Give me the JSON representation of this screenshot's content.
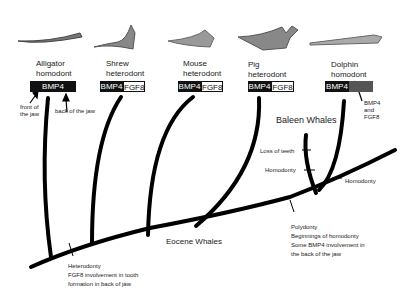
{
  "taxa": [
    {
      "name": "Alligator",
      "dentition": "homodont",
      "genes": [
        "BMP4"
      ]
    },
    {
      "name": "Shrew",
      "dentition": "heterodont",
      "genes": [
        "BMP4",
        "FGF8"
      ]
    },
    {
      "name": "Mouse",
      "dentition": "heterodont",
      "genes": [
        "BMP4",
        "FGF8"
      ]
    },
    {
      "name": "Pig",
      "dentition": "heterodont",
      "genes": [
        "BMP4",
        "FGF8"
      ]
    },
    {
      "name": "Dolphin",
      "dentition": "homodont",
      "genes": [
        "BMP4",
        ""
      ]
    }
  ],
  "annotations": {
    "front_of_jaw": "front of the jaw",
    "back_of_jaw": "back of the jaw",
    "dolphin_gray": "BMP4 and FGF8",
    "baleen": "Baleen Whales",
    "loss_of_teeth": "Loss of teeth",
    "homodonty_baleen": "Homodonty",
    "homodonty_dolphin": "Homodonty",
    "eocene": "Eocene Whales",
    "polydonty_1": "Polydonty",
    "polydonty_2": "Beginnings of homodonty",
    "polydonty_3": "Some BMP4 involvement in",
    "polydonty_4": "the back of the jaw",
    "hetero_1": "Heterodonty",
    "hetero_2": "FGF8 involvement in tooth",
    "hetero_3": "formation in back of jaw"
  }
}
